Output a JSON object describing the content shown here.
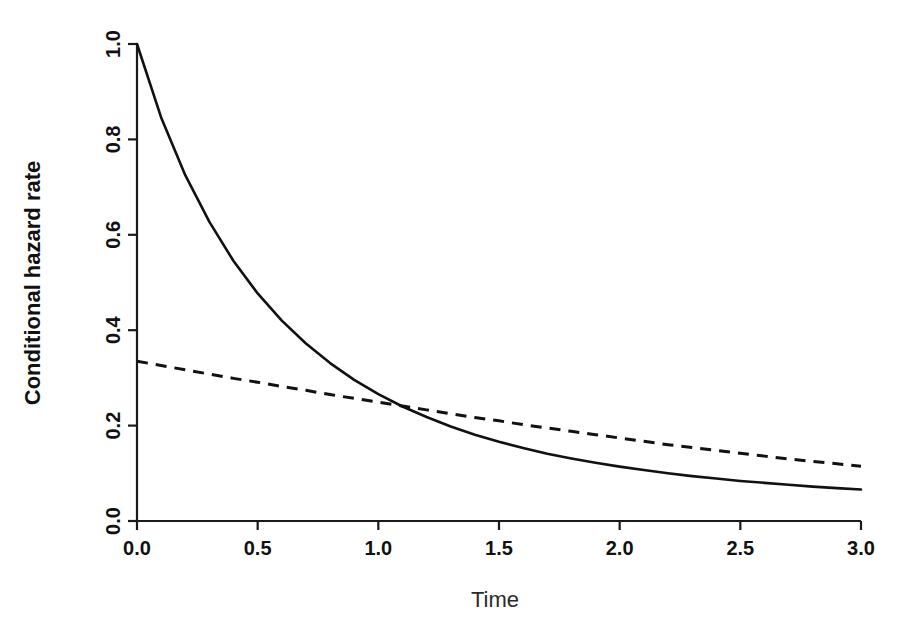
{
  "chart_data": {
    "type": "line",
    "title": "",
    "xlabel": "Time",
    "ylabel": "Conditional hazard rate",
    "xlim": [
      0.0,
      3.0
    ],
    "ylim": [
      0.0,
      1.0
    ],
    "grid": false,
    "legend": "none",
    "xticks": [
      "0.0",
      "0.5",
      "1.0",
      "1.5",
      "2.0",
      "2.5",
      "3.0"
    ],
    "xtick_values": [
      0.0,
      0.5,
      1.0,
      1.5,
      2.0,
      2.5,
      3.0
    ],
    "yticks": [
      "0.0",
      "0.2",
      "0.4",
      "0.6",
      "0.8",
      "1.0"
    ],
    "ytick_values": [
      0.0,
      0.2,
      0.4,
      0.6,
      0.8,
      1.0
    ],
    "series": [
      {
        "name": "solid-curve",
        "style": "solid",
        "color": "#111111",
        "x": [
          0.0,
          0.1,
          0.2,
          0.3,
          0.4,
          0.5,
          0.6,
          0.7,
          0.8,
          0.9,
          1.0,
          1.1,
          1.2,
          1.3,
          1.4,
          1.5,
          1.6,
          1.7,
          1.8,
          1.9,
          2.0,
          2.1,
          2.2,
          2.3,
          2.4,
          2.5,
          2.6,
          2.7,
          2.8,
          2.9,
          3.0
        ],
        "values": [
          1.0,
          0.846,
          0.725,
          0.627,
          0.545,
          0.477,
          0.42,
          0.372,
          0.331,
          0.296,
          0.266,
          0.24,
          0.218,
          0.198,
          0.181,
          0.166,
          0.153,
          0.141,
          0.131,
          0.122,
          0.114,
          0.107,
          0.1,
          0.094,
          0.089,
          0.084,
          0.08,
          0.076,
          0.072,
          0.069,
          0.066
        ]
      },
      {
        "name": "dashed-curve",
        "style": "dashed",
        "color": "#111111",
        "x": [
          0.0,
          0.1,
          0.2,
          0.3,
          0.4,
          0.5,
          0.6,
          0.7,
          0.8,
          0.9,
          1.0,
          1.1,
          1.2,
          1.3,
          1.4,
          1.5,
          1.6,
          1.7,
          1.8,
          1.9,
          2.0,
          2.1,
          2.2,
          2.3,
          2.4,
          2.5,
          2.6,
          2.7,
          2.8,
          2.9,
          3.0
        ],
        "values": [
          0.335,
          0.326,
          0.317,
          0.308,
          0.299,
          0.291,
          0.282,
          0.274,
          0.265,
          0.257,
          0.249,
          0.241,
          0.233,
          0.225,
          0.217,
          0.21,
          0.202,
          0.195,
          0.188,
          0.181,
          0.174,
          0.167,
          0.16,
          0.154,
          0.148,
          0.142,
          0.136,
          0.13,
          0.125,
          0.12,
          0.115
        ]
      }
    ],
    "annotations": [
      {
        "name": "curve-crossing",
        "x": 1.73,
        "y": 0.148
      }
    ]
  }
}
